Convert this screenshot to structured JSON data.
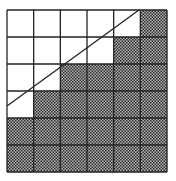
{
  "diagram": {
    "type": "grid-staircase",
    "rows": 6,
    "cols": 6,
    "grid_origin": [
      7,
      10
    ],
    "cell_width": 26.67,
    "cell_height": 27,
    "line_color": "#222222",
    "shade_pattern": "checkerboard",
    "shade_colors": [
      "#2a2a2a",
      "#b5b5b5"
    ],
    "shaded": [
      [
        0,
        0,
        0,
        0,
        0,
        1
      ],
      [
        0,
        0,
        0,
        0,
        1,
        1
      ],
      [
        0,
        0,
        1,
        1,
        1,
        1
      ],
      [
        0,
        1,
        1,
        1,
        1,
        1
      ],
      [
        1,
        1,
        1,
        1,
        1,
        1
      ],
      [
        1,
        1,
        1,
        1,
        1,
        1
      ]
    ],
    "diagonal": {
      "from": [
        139,
        10
      ],
      "to": [
        7,
        106
      ]
    }
  }
}
